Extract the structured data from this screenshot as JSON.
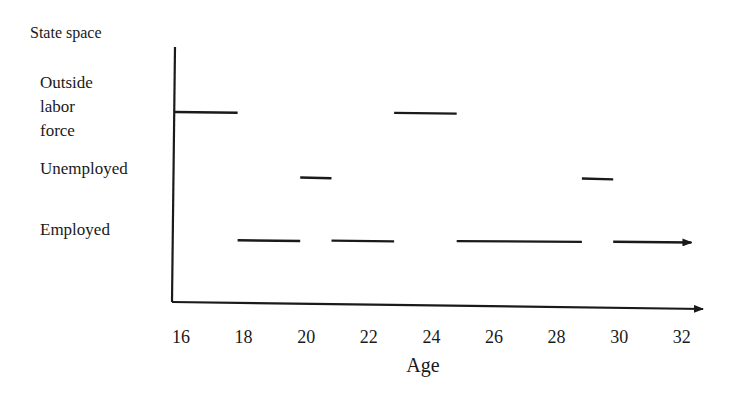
{
  "figure": {
    "ylabel": "State space",
    "xlabel": "Age",
    "states": [
      {
        "id": "outside",
        "label_lines": [
          "Outside",
          "labor",
          "force"
        ],
        "y": 112
      },
      {
        "id": "unemployed",
        "label_lines": [
          "Unemployed"
        ],
        "y": 177
      },
      {
        "id": "employed",
        "label_lines": [
          "Employed"
        ],
        "y": 240
      }
    ],
    "ticks": [
      "16",
      "18",
      "20",
      "22",
      "24",
      "26",
      "28",
      "30",
      "32"
    ]
  },
  "chart_data": {
    "type": "line",
    "title": "",
    "xlabel": "Age",
    "ylabel": "State space",
    "x_ticks": [
      16,
      18,
      20,
      22,
      24,
      26,
      28,
      30,
      32
    ],
    "xlim": [
      16,
      33
    ],
    "y_categories": [
      "Employed",
      "Unemployed",
      "Outside labor force"
    ],
    "grid": false,
    "series": [
      {
        "name": "Outside labor force",
        "segments": [
          [
            16,
            18
          ],
          [
            23,
            25
          ]
        ]
      },
      {
        "name": "Unemployed",
        "segments": [
          [
            20,
            21
          ],
          [
            29,
            30
          ]
        ]
      },
      {
        "name": "Employed",
        "segments": [
          [
            18,
            20
          ],
          [
            21,
            23
          ],
          [
            25,
            29
          ],
          [
            30,
            32.5
          ]
        ],
        "last_segment_arrow": true
      }
    ]
  }
}
